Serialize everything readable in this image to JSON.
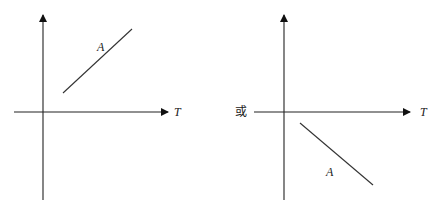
{
  "figure": {
    "panels": [
      {
        "name": "left",
        "x_axis_label": "T",
        "y_axis_label": "",
        "line_label": "A",
        "line_trend": "increasing",
        "line_region": "above T axis, right of vertical axis"
      },
      {
        "name": "right",
        "x_axis_label": "T",
        "y_axis_label": "",
        "line_label": "A",
        "line_trend": "decreasing",
        "line_region": "below T axis, right of vertical axis"
      }
    ],
    "connector_text": "或"
  }
}
